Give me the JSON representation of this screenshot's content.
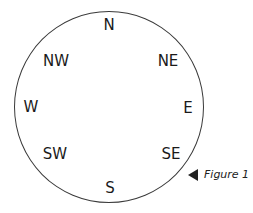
{
  "compass": {
    "N": "N",
    "NE": "NE",
    "E": "E",
    "SE": "SE",
    "S": "S",
    "SW": "SW",
    "W": "W",
    "NW": "NW"
  },
  "caption": {
    "icon": "left-pointing-triangle",
    "text": "Figure 1"
  }
}
